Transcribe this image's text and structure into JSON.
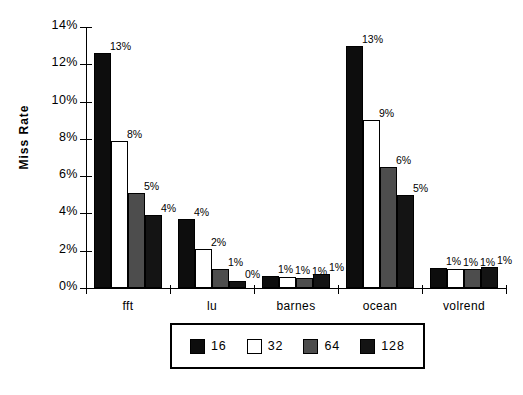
{
  "chart_data": {
    "type": "bar",
    "title": "",
    "xlabel": "",
    "ylabel": "Miss  Rate",
    "categories": [
      "fft",
      "lu",
      "barnes",
      "ocean",
      "volrend"
    ],
    "ylim": [
      0,
      14
    ],
    "ytick_labels": [
      "0%",
      "2%",
      "4%",
      "6%",
      "8%",
      "10%",
      "12%",
      "14%"
    ],
    "ytick_values": [
      0,
      2,
      4,
      6,
      8,
      10,
      12,
      14
    ],
    "grid": false,
    "legend_position": "bottom",
    "series": [
      {
        "name": "16",
        "color": "#0d0d0d",
        "values": [
          12.6,
          3.7,
          0.65,
          13.0,
          1.05
        ],
        "labels": [
          "13%",
          "4%",
          "1%",
          "13%",
          "1%"
        ]
      },
      {
        "name": "32",
        "color": "#ffffff",
        "values": [
          7.9,
          2.1,
          0.6,
          9.0,
          1.0
        ],
        "labels": [
          "8%",
          "2%",
          "1%",
          "9%",
          "1%"
        ]
      },
      {
        "name": "64",
        "color": "#4d4d4d",
        "values": [
          5.1,
          1.0,
          0.55,
          6.5,
          1.0
        ],
        "labels": [
          "5%",
          "1%",
          "1%",
          "6%",
          "1%"
        ]
      },
      {
        "name": "128",
        "color": "#141414",
        "values": [
          3.9,
          0.35,
          0.75,
          5.0,
          1.15
        ],
        "labels": [
          "4%",
          "0%",
          "1%",
          "5%",
          "1%"
        ]
      }
    ]
  },
  "legend": {
    "items": [
      {
        "label": "16"
      },
      {
        "label": "32"
      },
      {
        "label": "64"
      },
      {
        "label": "128"
      }
    ]
  }
}
